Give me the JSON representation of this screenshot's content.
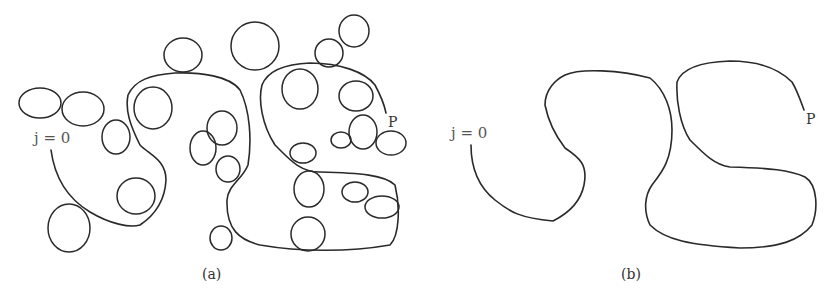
{
  "figure": {
    "panels": [
      {
        "id": "a",
        "caption": "(a)",
        "start_label": "j = 0",
        "end_label": "P",
        "description": "Random path from j=0 to P with many attached loops"
      },
      {
        "id": "b",
        "caption": "(b)",
        "start_label": "j = 0",
        "end_label": "P",
        "description": "Same path with loops erased"
      }
    ]
  }
}
